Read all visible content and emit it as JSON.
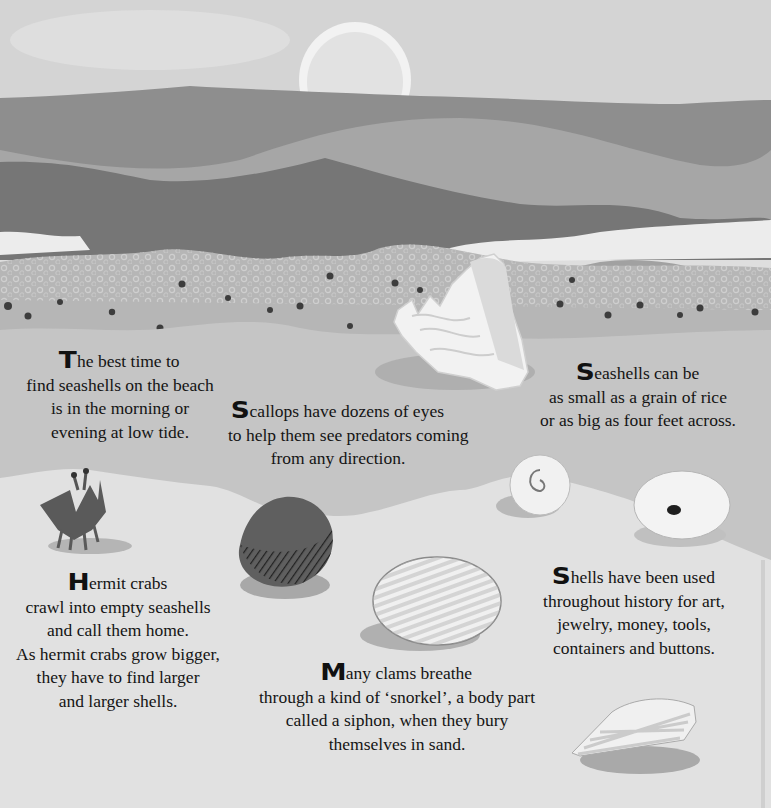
{
  "page": {
    "palette": {
      "sky": "#d3d3d3",
      "sun": "#e9e9e9",
      "far_hills": "#8f8f8f",
      "mid_hill": "#a9a9a9",
      "dark_hill": "#7a7a7a",
      "near_hill": "#a3a3a3",
      "foam": "#eeeeee",
      "pebble_band": "#b4b4b4",
      "wet_sand": "#c6c6c6",
      "dry_sand": "#e4e4e4",
      "text": "#141414"
    },
    "illustrations": [
      {
        "name": "sun-icon",
        "label": "setting sun"
      },
      {
        "name": "conch-shell-icon",
        "label": "conch shell"
      },
      {
        "name": "hermit-crab-icon",
        "label": "hermit crab"
      },
      {
        "name": "scallop-shell-icon",
        "label": "dark scallop shell"
      },
      {
        "name": "clam-shell-icon",
        "label": "striped clam shell"
      },
      {
        "name": "moon-snail-shell-icon",
        "label": "spiral snail shell"
      },
      {
        "name": "limpet-shell-icon",
        "label": "ribbed limpet shell"
      },
      {
        "name": "cone-shell-icon",
        "label": "striped cone shell"
      }
    ]
  },
  "passages": {
    "best_time": {
      "dropcap": "T",
      "lines": [
        "he best time to",
        "find seashells on the beach",
        "is in the morning or",
        "evening at low tide."
      ]
    },
    "scallops": {
      "dropcap": "S",
      "lines": [
        "callops have dozens of eyes",
        "to help them see predators coming",
        "from any direction."
      ]
    },
    "seashells_size": {
      "dropcap": "S",
      "lines": [
        "eashells can be",
        "as small as a grain of rice",
        "or as big as four feet across."
      ]
    },
    "hermit_crabs": {
      "dropcap": "H",
      "lines": [
        "ermit crabs",
        "crawl into empty seashells",
        "and call them home.",
        "As hermit crabs grow bigger,",
        "they have to find larger",
        "and larger shells."
      ]
    },
    "shells_used": {
      "dropcap": "S",
      "lines": [
        "hells have been used",
        "throughout history for art,",
        "jewelry, money, tools,",
        "containers and buttons."
      ]
    },
    "clams": {
      "dropcap": "M",
      "lines": [
        "any clams breathe",
        "through a kind of ‘snorkel’, a body part",
        "called a siphon, when they bury",
        "themselves in sand."
      ]
    }
  }
}
